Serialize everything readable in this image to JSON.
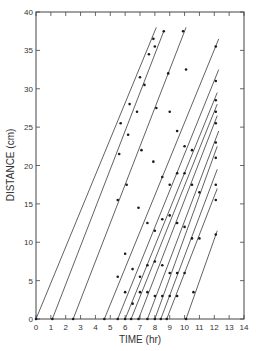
{
  "chart_data": {
    "type": "line",
    "title": "",
    "xlabel": "TIME (hr)",
    "ylabel": "DISTANCE (cm)",
    "xlim": [
      0,
      14
    ],
    "ylim": [
      0,
      40
    ],
    "xticks": [
      0,
      1,
      2,
      3,
      4,
      5,
      6,
      7,
      8,
      9,
      10,
      11,
      12,
      13,
      14
    ],
    "yticks": [
      0,
      5,
      10,
      15,
      20,
      25,
      30,
      35,
      40
    ],
    "grid": false,
    "legend": null,
    "series": [
      {
        "name": "line-1",
        "start": [
          0.0,
          0
        ],
        "end": [
          8.1,
          38.0
        ],
        "points": [
          [
            0.0,
            0
          ],
          [
            5.7,
            25.5
          ],
          [
            6.3,
            28.0
          ],
          [
            7.0,
            31.5
          ],
          [
            7.6,
            34.5
          ],
          [
            7.9,
            36.5
          ]
        ]
      },
      {
        "name": "line-2",
        "start": [
          1.1,
          0
        ],
        "end": [
          8.6,
          37.5
        ],
        "points": [
          [
            1.1,
            0
          ],
          [
            5.6,
            21.5
          ],
          [
            6.2,
            24.0
          ],
          [
            6.8,
            27.0
          ],
          [
            7.3,
            30.5
          ],
          [
            8.0,
            35.5
          ],
          [
            8.6,
            37.5
          ]
        ]
      },
      {
        "name": "line-3",
        "start": [
          2.5,
          0
        ],
        "end": [
          10.1,
          38.0
        ],
        "points": [
          [
            2.5,
            0
          ],
          [
            5.5,
            15.5
          ],
          [
            6.1,
            17.5
          ],
          [
            7.1,
            22.0
          ],
          [
            8.1,
            27.5
          ],
          [
            8.9,
            32.0
          ],
          [
            9.9,
            37.5
          ]
        ]
      },
      {
        "name": "line-4",
        "start": [
          4.6,
          0
        ],
        "end": [
          12.3,
          36.5
        ],
        "points": [
          [
            4.6,
            0
          ],
          [
            5.5,
            5.5
          ],
          [
            6.0,
            8.5
          ],
          [
            6.9,
            14.5
          ],
          [
            7.9,
            20.5
          ],
          [
            9.0,
            27.0
          ],
          [
            10.1,
            32.5
          ],
          [
            12.1,
            35.5
          ]
        ]
      },
      {
        "name": "line-5",
        "start": [
          5.5,
          0
        ],
        "end": [
          12.3,
          32.5
        ],
        "points": [
          [
            5.5,
            0
          ],
          [
            6.0,
            3.5
          ],
          [
            6.5,
            6.5
          ],
          [
            7.5,
            12.5
          ],
          [
            8.5,
            18.5
          ],
          [
            9.5,
            24.5
          ],
          [
            12.1,
            31.0
          ]
        ]
      },
      {
        "name": "line-6",
        "start": [
          6.0,
          0
        ],
        "end": [
          12.2,
          29.5
        ],
        "points": [
          [
            6.0,
            0
          ],
          [
            6.5,
            2.0
          ],
          [
            7.0,
            5.5
          ],
          [
            8.0,
            11.5
          ],
          [
            9.0,
            17.5
          ],
          [
            10.0,
            22.5
          ],
          [
            12.1,
            28.5
          ]
        ]
      },
      {
        "name": "line-7",
        "start": [
          6.4,
          0
        ],
        "end": [
          12.2,
          28.0
        ],
        "points": [
          [
            6.4,
            0
          ],
          [
            7.0,
            3.5
          ],
          [
            7.5,
            7.0
          ],
          [
            8.5,
            13.0
          ],
          [
            9.5,
            19.0
          ],
          [
            10.5,
            22.0
          ],
          [
            12.1,
            27.0
          ]
        ]
      },
      {
        "name": "line-8",
        "start": [
          6.9,
          0
        ],
        "end": [
          12.2,
          26.5
        ],
        "points": [
          [
            6.9,
            0
          ],
          [
            7.5,
            3.5
          ],
          [
            8.0,
            7.5
          ],
          [
            9.0,
            13.5
          ],
          [
            10.0,
            19.0
          ],
          [
            12.1,
            25.5
          ]
        ]
      },
      {
        "name": "line-9",
        "start": [
          7.5,
          0
        ],
        "end": [
          12.3,
          24.5
        ],
        "points": [
          [
            7.5,
            0
          ],
          [
            8.0,
            3.0
          ],
          [
            8.5,
            7.0
          ],
          [
            9.5,
            12.5
          ],
          [
            10.5,
            17.5
          ],
          [
            12.1,
            23.0
          ]
        ]
      },
      {
        "name": "line-10",
        "start": [
          8.0,
          0
        ],
        "end": [
          12.2,
          22.5
        ],
        "points": [
          [
            8.0,
            0
          ],
          [
            8.5,
            3.0
          ],
          [
            9.0,
            6.0
          ],
          [
            10.0,
            12.0
          ],
          [
            11.0,
            16.5
          ],
          [
            12.1,
            21.0
          ]
        ]
      },
      {
        "name": "line-11",
        "start": [
          8.4,
          0
        ],
        "end": [
          12.2,
          19.5
        ],
        "points": [
          [
            8.4,
            0
          ],
          [
            9.0,
            3.0
          ],
          [
            9.5,
            6.0
          ],
          [
            10.5,
            10.5
          ],
          [
            12.1,
            17.5
          ]
        ]
      },
      {
        "name": "line-12",
        "start": [
          8.8,
          0
        ],
        "end": [
          12.2,
          17.0
        ],
        "points": [
          [
            8.8,
            0
          ],
          [
            9.5,
            3.0
          ],
          [
            10.0,
            6.0
          ],
          [
            11.0,
            10.5
          ],
          [
            12.1,
            15.5
          ]
        ]
      },
      {
        "name": "line-13",
        "start": [
          10.1,
          0
        ],
        "end": [
          12.2,
          11.5
        ],
        "points": [
          [
            10.1,
            0
          ],
          [
            10.6,
            3.5
          ],
          [
            12.1,
            11.0
          ]
        ]
      }
    ]
  },
  "axes": {
    "x_title": "TIME (hr)",
    "y_title": "DISTANCE (cm)",
    "x_tick_labels": [
      "0",
      "1",
      "2",
      "3",
      "4",
      "5",
      "6",
      "7",
      "8",
      "9",
      "10",
      "11",
      "12",
      "13",
      "14"
    ],
    "y_tick_labels": [
      "0",
      "5",
      "10",
      "15",
      "20",
      "25",
      "30",
      "35",
      "40"
    ]
  },
  "colors": {
    "line": "#3a3a3a",
    "point": "#1a1a1a",
    "axis": "#444444",
    "background": "#ffffff"
  }
}
